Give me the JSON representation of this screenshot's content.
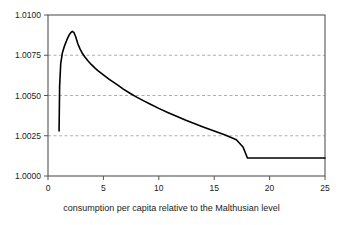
{
  "chart_data": {
    "type": "line",
    "title": "",
    "subtitle": "",
    "xlabel": "consumption per capita relative to the Malthusian level",
    "ylabel": "",
    "xlim": [
      0,
      25
    ],
    "ylim": [
      1.0,
      1.01
    ],
    "xticks": [
      0,
      5,
      10,
      15,
      20,
      25
    ],
    "xtick_labels": [
      "0",
      "5",
      "10",
      "15",
      "20",
      "25"
    ],
    "yticks": [
      1.0,
      1.0025,
      1.005,
      1.0075,
      1.01
    ],
    "ytick_labels": [
      "1.0000",
      "1.0025",
      "1.0050",
      "1.0075",
      "1.0100"
    ],
    "grid": {
      "horizontal": true,
      "vertical": false,
      "style": "dashed",
      "at": [
        1.0025,
        1.005,
        1.0075
      ],
      "color": "#9a9a9a"
    },
    "legend": null,
    "legend_position": "none",
    "annotations": [],
    "line_color": "#000000",
    "line_width": 1.6,
    "series": [
      {
        "name": "policy function",
        "x": [
          1.0,
          1.05,
          1.15,
          1.3,
          1.5,
          1.7,
          1.9,
          2.05,
          2.2,
          2.35,
          2.5,
          2.7,
          2.9,
          3.1,
          3.3,
          3.6,
          3.9,
          4.2,
          4.5,
          5.0,
          5.5,
          6.0,
          6.3,
          6.8,
          7.4,
          8.0,
          8.6,
          9.2,
          10.0,
          10.8,
          11.6,
          12.5,
          13.2,
          14.0,
          15.0,
          16.0,
          17.0,
          17.6,
          18.0,
          19.0,
          20.0,
          21.0,
          22.0,
          23.0,
          24.0,
          25.0
        ],
        "y": [
          1.0028,
          1.0056,
          1.007,
          1.00765,
          1.0081,
          1.00845,
          1.00875,
          1.0089,
          1.00898,
          1.0089,
          1.00865,
          1.0082,
          1.00788,
          1.00762,
          1.00742,
          1.00716,
          1.00693,
          1.00673,
          1.00655,
          1.00628,
          1.00602,
          1.00578,
          1.00564,
          1.0054,
          1.00514,
          1.0049,
          1.00468,
          1.00447,
          1.0042,
          1.00395,
          1.00371,
          1.00345,
          1.00326,
          1.00305,
          1.0028,
          1.00254,
          1.00225,
          1.0018,
          1.00112,
          1.00112,
          1.00112,
          1.00112,
          1.00112,
          1.00112,
          1.00112,
          1.00112
        ]
      }
    ],
    "notes": {
      "peak_x": 2.2,
      "peak_y": 1.009,
      "start_x": 1.0,
      "start_y": 1.0028,
      "plateau_from_x": 18,
      "plateau_value": 1.0011
    }
  },
  "axes": {
    "frame_color": "#555555",
    "tick_color": "#555555"
  }
}
